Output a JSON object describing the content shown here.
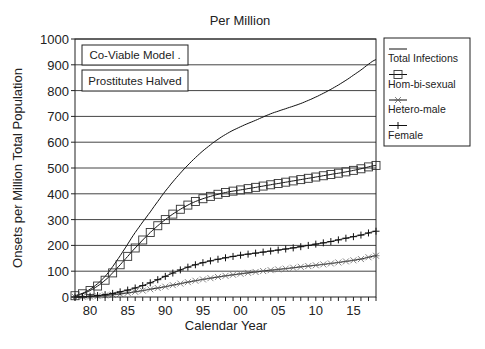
{
  "chart_data": {
    "type": "line",
    "title": "Per Million",
    "xlabel": "Calendar Year",
    "ylabel": "Onsets per Million Total Population",
    "xlim": [
      1978,
      2018
    ],
    "ylim": [
      0,
      1000
    ],
    "yticks": [
      0,
      100,
      200,
      300,
      400,
      500,
      600,
      700,
      800,
      900,
      1000
    ],
    "xtick_labels": [
      {
        "year": 1980,
        "label": "80"
      },
      {
        "year": 1985,
        "label": "85"
      },
      {
        "year": 1990,
        "label": "90"
      },
      {
        "year": 1995,
        "label": "95"
      },
      {
        "year": 2000,
        "label": "00"
      },
      {
        "year": 2005,
        "label": "05"
      },
      {
        "year": 2010,
        "label": "10"
      },
      {
        "year": 2015,
        "label": "15"
      }
    ],
    "grid": "horizontal",
    "legend_position": "right",
    "annotations": [
      "Co-Viable  Model .",
      "Prostitutes  Halved"
    ],
    "x": [
      1978,
      1980,
      1982,
      1984,
      1986,
      1988,
      1990,
      1992,
      1994,
      1996,
      1998,
      2000,
      2002,
      2004,
      2006,
      2008,
      2010,
      2012,
      2014,
      2016,
      2018
    ],
    "series": [
      {
        "name": "Total Infections",
        "marker": "none",
        "values": [
          5,
          30,
          80,
          160,
          250,
          330,
          410,
          480,
          540,
          590,
          630,
          660,
          685,
          710,
          730,
          750,
          775,
          805,
          840,
          880,
          920
        ]
      },
      {
        "name": "Hom-bi-sexual",
        "marker": "square",
        "values": [
          5,
          25,
          65,
          125,
          190,
          250,
          300,
          340,
          370,
          390,
          405,
          415,
          425,
          435,
          445,
          455,
          465,
          475,
          485,
          497,
          510
        ]
      },
      {
        "name": "Hetero-male",
        "marker": "asterisk",
        "values": [
          0,
          2,
          6,
          12,
          20,
          30,
          40,
          52,
          63,
          73,
          82,
          90,
          97,
          104,
          110,
          117,
          123,
          130,
          138,
          147,
          160
        ]
      },
      {
        "name": "Female",
        "marker": "plus",
        "values": [
          0,
          3,
          9,
          20,
          35,
          55,
          80,
          105,
          125,
          140,
          152,
          162,
          170,
          178,
          186,
          195,
          205,
          215,
          228,
          240,
          255
        ]
      }
    ]
  }
}
